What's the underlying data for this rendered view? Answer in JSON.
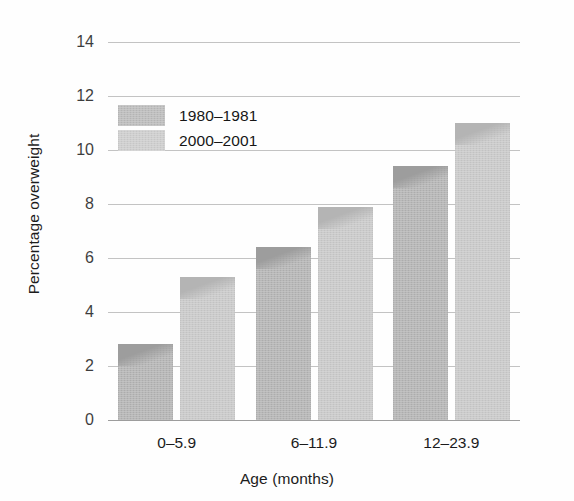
{
  "chart_data": {
    "type": "bar",
    "title": "",
    "xlabel": "Age (months)",
    "ylabel": "Percentage overweight",
    "categories": [
      "0–5.9",
      "6–11.9",
      "12–23.9"
    ],
    "series": [
      {
        "name": "1980–1981",
        "values": [
          2.8,
          6.4,
          9.4
        ],
        "color": "#b0b0b0"
      },
      {
        "name": "2000–2001",
        "values": [
          5.3,
          7.9,
          11.0
        ],
        "color": "#c6c6c6"
      }
    ],
    "ylim": [
      0,
      14
    ],
    "yticks": [
      0,
      2,
      4,
      6,
      8,
      10,
      12,
      14
    ],
    "ytick_labels": [
      "0",
      "2",
      "4",
      "6",
      "8",
      "10",
      "12",
      "14"
    ],
    "grid": true,
    "grid_axis": "y",
    "legend_position": "upper-left-inside",
    "background_color": "#fefefe"
  }
}
